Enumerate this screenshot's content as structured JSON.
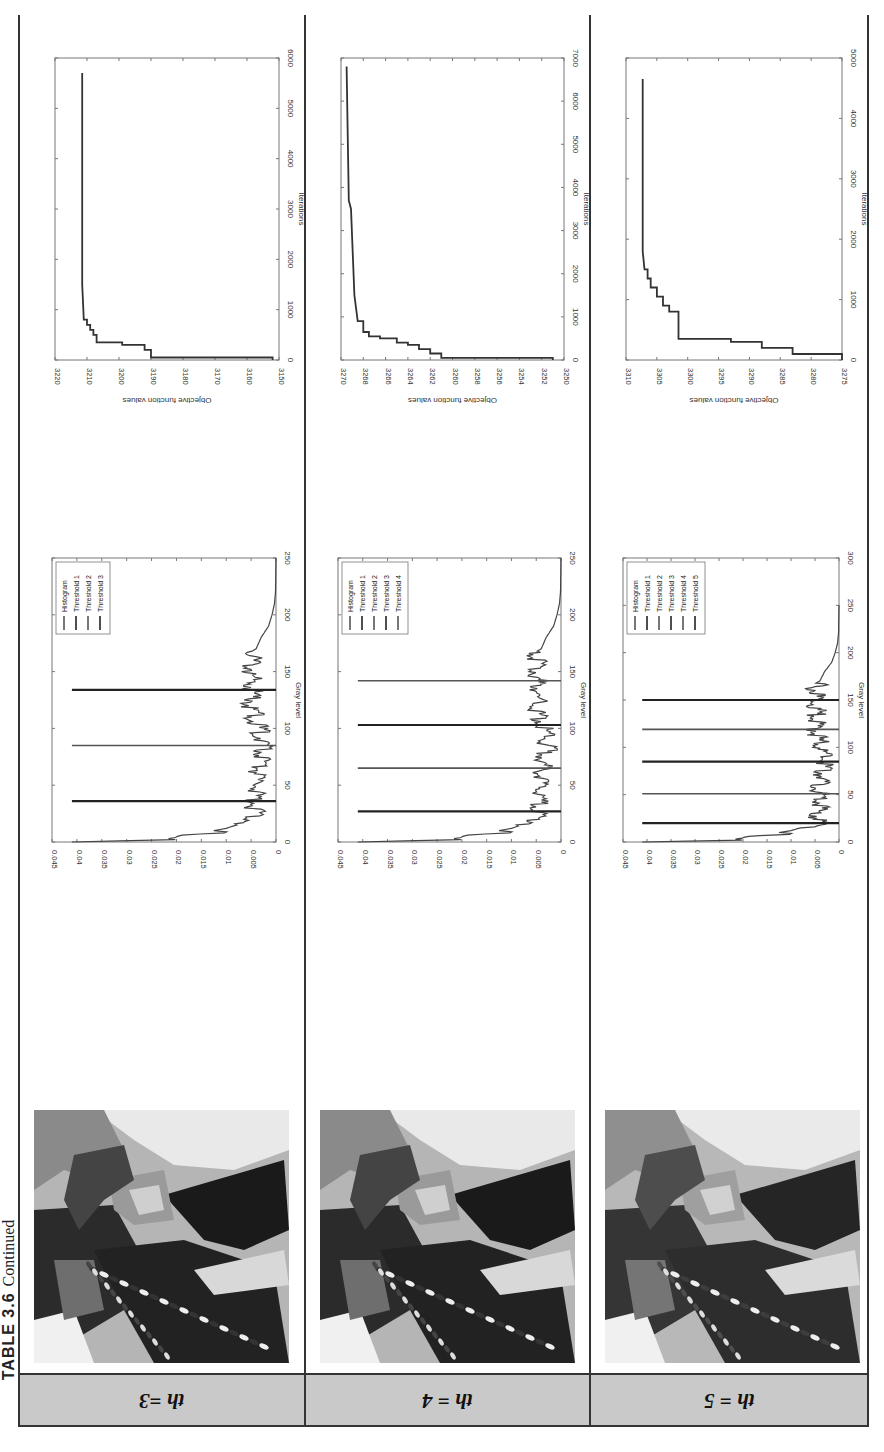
{
  "page": {
    "caption_label": "TABLE 3.6",
    "caption_suffix": "Continued",
    "orientation_note": "content rotated 90 degrees"
  },
  "rows": [
    {
      "label": "th =3",
      "image_alt": "Segmented image (3 thresholds)"
    },
    {
      "label": "th = 4",
      "image_alt": "Segmented image (4 thresholds)"
    },
    {
      "label": "th = 5",
      "image_alt": "Segmented image (5 thresholds)"
    }
  ],
  "chart_data": [
    {
      "type": "line",
      "title": "Histogram with thresholds (th=3)",
      "xlabel": "Gray level",
      "ylabel": "Frequency",
      "xlim": [
        0,
        250
      ],
      "ylim": [
        0,
        0.045
      ],
      "xticks": [
        0,
        50,
        100,
        150,
        200,
        250
      ],
      "yticks": [
        0,
        0.005,
        0.01,
        0.015,
        0.02,
        0.025,
        0.03,
        0.035,
        0.04,
        0.045
      ],
      "legend": [
        "Histogram",
        "Threshold 1",
        "Threshold 2",
        "Threshold 3"
      ],
      "legend_position": "upper right",
      "thresholds": [
        36,
        85,
        134
      ],
      "threshold_height": 0.041,
      "histogram_profile": {
        "x": [
          0,
          2,
          5,
          8,
          12,
          18,
          25,
          40,
          60,
          80,
          90,
          100,
          110,
          120,
          130,
          140,
          150,
          160,
          165,
          170,
          180,
          190,
          200,
          210,
          220,
          250
        ],
        "y": [
          0.041,
          0.022,
          0.02,
          0.015,
          0.01,
          0.006,
          0.0055,
          0.005,
          0.005,
          0.004,
          0.0038,
          0.0045,
          0.0055,
          0.006,
          0.0058,
          0.0058,
          0.006,
          0.0058,
          0.006,
          0.004,
          0.003,
          0.0015,
          0.0008,
          0.0003,
          0.0001,
          0
        ]
      }
    },
    {
      "type": "line",
      "title": "Convergence (th=3)",
      "xlabel": "Iterations",
      "ylabel": "Objective function values",
      "xlim": [
        0,
        6000
      ],
      "ylim": [
        3150,
        3220
      ],
      "xticks": [
        0,
        1000,
        2000,
        3000,
        4000,
        5000,
        6000
      ],
      "yticks": [
        3150,
        3160,
        3170,
        3180,
        3190,
        3200,
        3210,
        3220
      ],
      "x": [
        0,
        50,
        50,
        200,
        200,
        300,
        300,
        350,
        350,
        500,
        500,
        600,
        600,
        700,
        700,
        800,
        800,
        1500,
        5700
      ],
      "y": [
        3152,
        3152,
        3190,
        3190,
        3192,
        3192,
        3199,
        3199,
        3207,
        3207,
        3208,
        3208,
        3209,
        3209,
        3210,
        3210,
        3211,
        3211.5,
        3211.5
      ]
    },
    {
      "type": "line",
      "title": "Histogram with thresholds (th=4)",
      "xlabel": "Gray level",
      "ylabel": "Frequency",
      "xlim": [
        0,
        250
      ],
      "ylim": [
        0,
        0.045
      ],
      "xticks": [
        0,
        50,
        100,
        150,
        200,
        250
      ],
      "yticks": [
        0,
        0.005,
        0.01,
        0.015,
        0.02,
        0.025,
        0.03,
        0.035,
        0.04,
        0.045
      ],
      "legend": [
        "Histogram",
        "Threshold 1",
        "Threshold 2",
        "Threshold 3",
        "Threshold 4"
      ],
      "legend_position": "upper right",
      "thresholds": [
        27,
        65,
        103,
        142
      ],
      "threshold_height": 0.041
    },
    {
      "type": "line",
      "title": "Convergence (th=4)",
      "xlabel": "Iterations",
      "ylabel": "Objective function values",
      "xlim": [
        0,
        7000
      ],
      "ylim": [
        3250,
        3270
      ],
      "xticks": [
        0,
        1000,
        2000,
        3000,
        4000,
        5000,
        6000,
        7000
      ],
      "yticks": [
        3250,
        3252,
        3254,
        3256,
        3258,
        3260,
        3262,
        3264,
        3266,
        3268,
        3270
      ],
      "x": [
        0,
        50,
        50,
        150,
        150,
        250,
        250,
        350,
        350,
        400,
        400,
        500,
        500,
        550,
        550,
        650,
        650,
        900,
        900,
        1500,
        3500,
        3700,
        6800
      ],
      "y": [
        3251,
        3251,
        3261,
        3261,
        3262,
        3262,
        3263,
        3263,
        3264,
        3264,
        3265,
        3265,
        3266.5,
        3266.5,
        3267.5,
        3267.5,
        3268,
        3268,
        3268.5,
        3268.8,
        3269.1,
        3269.3,
        3269.5
      ]
    },
    {
      "type": "line",
      "title": "Histogram with thresholds (th=5)",
      "xlabel": "Gray level",
      "ylabel": "Frequency",
      "xlim": [
        0,
        300
      ],
      "ylim": [
        0,
        0.045
      ],
      "xticks": [
        0,
        50,
        100,
        150,
        200,
        250,
        300
      ],
      "yticks": [
        0,
        0.005,
        0.01,
        0.015,
        0.02,
        0.025,
        0.03,
        0.035,
        0.04,
        0.045
      ],
      "legend": [
        "Histogram",
        "Threshold 1",
        "Threshold 2",
        "Threshold 3",
        "Threshold 4",
        "Threshold 5"
      ],
      "legend_position": "upper right",
      "thresholds": [
        20,
        51,
        85,
        119,
        150
      ],
      "threshold_height": 0.041
    },
    {
      "type": "line",
      "title": "Convergence (th=5)",
      "xlabel": "Iterations",
      "ylabel": "Objective function values",
      "xlim": [
        0,
        5000
      ],
      "ylim": [
        3275,
        3310
      ],
      "xticks": [
        0,
        1000,
        2000,
        3000,
        4000,
        5000
      ],
      "yticks": [
        3275,
        3280,
        3285,
        3290,
        3295,
        3300,
        3305,
        3310
      ],
      "x": [
        0,
        100,
        100,
        200,
        200,
        300,
        300,
        350,
        350,
        800,
        800,
        900,
        900,
        1050,
        1050,
        1200,
        1200,
        1350,
        1350,
        1500,
        1500,
        1800,
        4650
      ],
      "y": [
        3275,
        3275,
        3283,
        3283,
        3288,
        3288,
        3293,
        3293,
        3301.5,
        3301.5,
        3303,
        3303,
        3304,
        3304,
        3305,
        3305,
        3306,
        3306,
        3306.5,
        3306.5,
        3307,
        3307.3,
        3307.3
      ]
    }
  ]
}
